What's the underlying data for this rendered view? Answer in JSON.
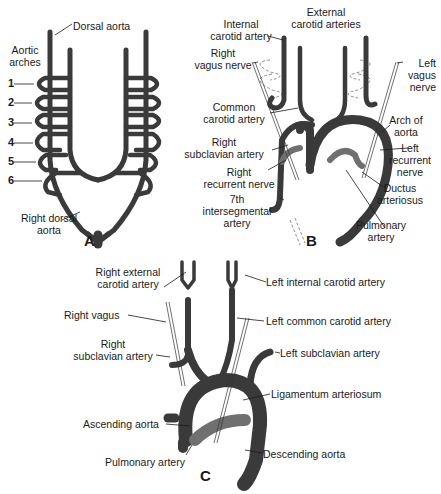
{
  "panel_a": {
    "letter": "A",
    "labels": {
      "dorsal_aorta": "Dorsal aorta",
      "aortic_arches_1": "Aortic",
      "aortic_arches_2": "arches",
      "right_dorsal_aorta_1": "Right dorsal",
      "right_dorsal_aorta_2": "aorta"
    },
    "arch_numbers": [
      "1",
      "2",
      "3",
      "4",
      "5",
      "6"
    ]
  },
  "panel_b": {
    "letter": "B",
    "labels": {
      "internal_carotid_1": "Internal",
      "internal_carotid_2": "carotid artery",
      "external_carotid_1": "External",
      "external_carotid_2": "carotid arteries",
      "right_vagus_1": "Right",
      "right_vagus_2": "vagus nerve",
      "left_vagus_1": "Left",
      "left_vagus_2": "vagus",
      "left_vagus_3": "nerve",
      "common_carotid_1": "Common",
      "common_carotid_2": "carotid artery",
      "arch_of_aorta_1": "Arch of",
      "arch_of_aorta_2": "aorta",
      "right_subclavian_1": "Right",
      "right_subclavian_2": "subclavian artery",
      "left_recurrent_1": "Left",
      "left_recurrent_2": "recurrent",
      "left_recurrent_3": "nerve",
      "right_recurrent_1": "Right",
      "right_recurrent_2": "recurrent nerve",
      "ductus_1": "Ductus",
      "ductus_2": "arteriosus",
      "seventh_1": "7th",
      "seventh_2": "intersegmental",
      "seventh_3": "artery",
      "pulmonary_1": "Pulmonary",
      "pulmonary_2": "artery"
    }
  },
  "panel_c": {
    "letter": "C",
    "labels": {
      "right_external_carotid_1": "Right external",
      "right_external_carotid_2": "carotid artery",
      "left_internal_carotid": "Left internal carotid artery",
      "right_vagus": "Right vagus",
      "left_common_carotid": "Left common carotid artery",
      "right_subclavian_1": "Right",
      "right_subclavian_2": "subclavian artery",
      "left_subclavian": "Left subclavian artery",
      "ligamentum": "Ligamentum arteriosum",
      "ascending_aorta": "Ascending aorta",
      "pulmonary_artery": "Pulmonary artery",
      "descending_aorta": "Descending aorta"
    }
  },
  "colors": {
    "vessel": "#3a3a3a",
    "vessel_light": "#6a6a6a",
    "line": "#1a1a1a",
    "background": "#ffffff"
  }
}
